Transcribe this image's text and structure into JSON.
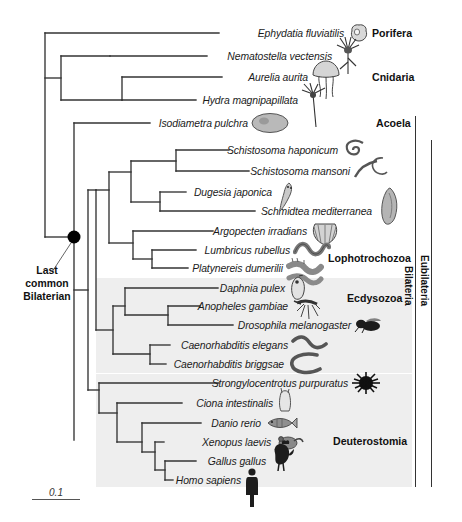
{
  "figure": {
    "kind": "phylogenetic-tree",
    "root_annotation": "Last\ncommon\nBilaterian",
    "root_annotation_lines": [
      "Last",
      "common",
      "Bilaterian"
    ],
    "scale_bar_value": "0.1"
  },
  "taxa": [
    {
      "name": "Ephydatia fluviatilis",
      "icon": "sponge-icon",
      "y": 33
    },
    {
      "name": "Nematostella vectensis",
      "icon": "sea-anemone-icon",
      "y": 56
    },
    {
      "name": "Aurelia aurita",
      "icon": "jellyfish-icon",
      "y": 77
    },
    {
      "name": "Hydra magnipapillata",
      "icon": "hydra-icon",
      "y": 100
    },
    {
      "name": "Isodiametra pulchra",
      "icon": "acoel-worm-icon",
      "y": 123
    },
    {
      "name": "Schistosoma haponicum",
      "icon": "fluke-icon",
      "y": 150
    },
    {
      "name": "Schistosoma mansoni",
      "icon": "fluke-pair-icon",
      "y": 171
    },
    {
      "name": "Dugesia japonica",
      "icon": "planarian-icon",
      "y": 192
    },
    {
      "name": "Schmidtea mediterranea",
      "icon": "flatworm-icon",
      "y": 211
    },
    {
      "name": "Argopecten irradians",
      "icon": "scallop-icon",
      "y": 231
    },
    {
      "name": "Lumbricus rubellus",
      "icon": "earthworm-icon",
      "y": 250
    },
    {
      "name": "Platynereis dumerilii",
      "icon": "polychaete-icon",
      "y": 268
    },
    {
      "name": "Daphnia pulex",
      "icon": "water-flea-icon",
      "y": 288
    },
    {
      "name": "Anopheles gambiae",
      "icon": "mosquito-icon",
      "y": 306
    },
    {
      "name": "Drosophila melanogaster",
      "icon": "fruit-fly-icon",
      "y": 325
    },
    {
      "name": "Caenorhabditis elegans",
      "icon": "nematode-icon",
      "y": 345
    },
    {
      "name": "Caenorhabditis briggsae",
      "icon": "nematode-icon",
      "y": 364
    },
    {
      "name": "Strongylocentrotus purpuratus",
      "icon": "sea-urchin-icon",
      "y": 383
    },
    {
      "name": "Ciona intestinalis",
      "icon": "sea-squirt-icon",
      "y": 403
    },
    {
      "name": "Danio rerio",
      "icon": "zebrafish-icon",
      "y": 423
    },
    {
      "name": "Xenopus laevis",
      "icon": "frog-icon",
      "y": 442
    },
    {
      "name": "Gallus gallus",
      "icon": "chicken-icon",
      "y": 461
    },
    {
      "name": "Homo sapiens",
      "icon": "human-icon",
      "y": 480
    }
  ],
  "groups": [
    {
      "label": "Porifera",
      "y": 33,
      "x": 372
    },
    {
      "label": "Cnidaria",
      "y": 77,
      "x": 372
    },
    {
      "label": "Acoela",
      "y": 123,
      "x": 380
    },
    {
      "label": "Lophotrochozoa",
      "y": 258,
      "x": 330
    },
    {
      "label": "Ecdysozoa",
      "y": 298,
      "x": 347
    },
    {
      "label": "Deuterostomia",
      "y": 440,
      "x": 335
    }
  ],
  "brackets": [
    {
      "label": "Bilateria",
      "x": 415,
      "top": 116,
      "bottom": 487,
      "label_x": 408,
      "label_y": 270
    },
    {
      "label": "Eubilateria",
      "x": 431,
      "top": 140,
      "bottom": 487,
      "label_x": 424,
      "label_y": 262
    }
  ],
  "colors": {
    "band_fill": "#eeeeee",
    "branch_stroke": "#333333",
    "text": "#1b1b1b",
    "bracket": "#333333",
    "root_node": "#000000"
  },
  "bands": [
    {
      "name": "ecdysozoa-band",
      "x": 96,
      "y": 278,
      "w": 316,
      "h": 95
    },
    {
      "name": "deuterostomia-band",
      "x": 96,
      "y": 374,
      "w": 316,
      "h": 113
    }
  ]
}
